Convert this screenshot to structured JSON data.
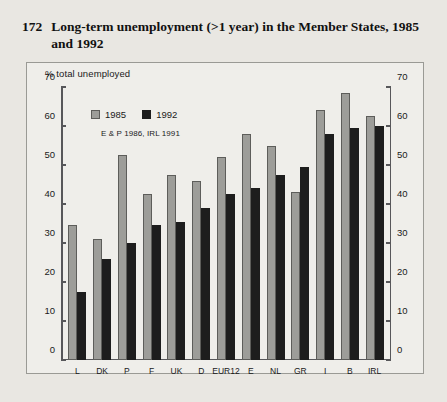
{
  "title": {
    "number": "172",
    "text": "Long-term unemployment (>1 year) in the Member States, 1985 and 1992"
  },
  "legend": {
    "series": [
      {
        "label": "1985",
        "color": "#9d9d99"
      },
      {
        "label": "1992",
        "color": "#1d1d1d"
      }
    ],
    "note": "E & P 1986, IRL 1991"
  },
  "chart_data": {
    "type": "bar",
    "title": "Long-term unemployment (>1 year) in the Member States, 1985 and 1992",
    "xlabel": "",
    "ylabel": "% total unemployed",
    "ylim": [
      0,
      70
    ],
    "ytick_step": 10,
    "yticks": [
      0,
      10,
      20,
      30,
      40,
      50,
      60,
      70
    ],
    "ytick_labels": [
      "0",
      "10",
      "20",
      "30",
      "40",
      "50",
      "60",
      "70"
    ],
    "grid": false,
    "dual_axis": true,
    "legend_position": "top-left inside plot",
    "annotation": "E & P 1986, IRL 1991",
    "categories": [
      "L",
      "DK",
      "P",
      "F",
      "UK",
      "D",
      "EUR12",
      "E",
      "NL",
      "GR",
      "I",
      "B",
      "IRL"
    ],
    "series": [
      {
        "name": "1985",
        "color": "#9d9d99",
        "values": [
          34.5,
          31.0,
          52.5,
          42.5,
          47.5,
          46.0,
          52.0,
          58.0,
          55.0,
          43.0,
          64.0,
          68.5,
          62.5
        ]
      },
      {
        "name": "1992",
        "color": "#1d1d1d",
        "values": [
          17.5,
          26.0,
          30.0,
          34.5,
          35.5,
          39.0,
          42.5,
          44.0,
          47.5,
          49.5,
          58.0,
          59.5,
          60.0
        ]
      }
    ]
  }
}
